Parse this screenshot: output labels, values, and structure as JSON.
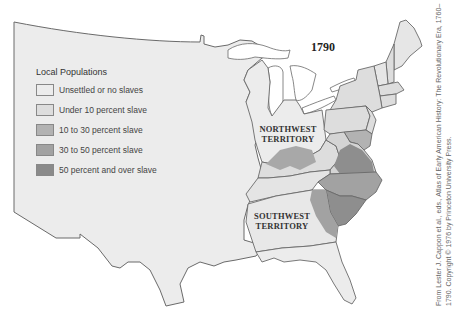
{
  "map": {
    "title": "1790",
    "territories": {
      "northwest": [
        "NORTHWEST",
        "TERRITORY"
      ],
      "southwest": [
        "SOUTHWEST",
        "TERRITORY"
      ]
    },
    "legend": {
      "title": "Local Populations",
      "items": [
        {
          "label": "Unsettled or no slaves",
          "color": "#ececec"
        },
        {
          "label": "Under 10 percent slave",
          "color": "#dddddd"
        },
        {
          "label": "10 to 30 percent slave",
          "color": "#b2b2b2"
        },
        {
          "label": "30 to 50 percent slave",
          "color": "#a2a2a2"
        },
        {
          "label": "50 percent and over slave",
          "color": "#8a8a8a"
        }
      ]
    },
    "credit": {
      "line1": "From Lester J. Cappon et al., eds., Atlas of Early American History: The Revolutionary Era, 1760–",
      "line2": "1790. Copyright © 1976 by Princeton University Press."
    },
    "colors": {
      "land": "#ececec",
      "states": "#dddddd",
      "border": "#6a6a6a",
      "water": "#ffffff"
    }
  }
}
